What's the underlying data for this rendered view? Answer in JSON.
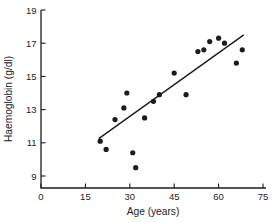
{
  "chart_data": {
    "type": "scatter",
    "title": "",
    "xlabel": "Age (years)",
    "ylabel": "Haemoglobin (g/dl)",
    "xlim": [
      0,
      75
    ],
    "ylim": [
      8.3,
      19
    ],
    "xticks": [
      0,
      15,
      30,
      45,
      60,
      75
    ],
    "yticks": [
      9,
      11,
      13,
      15,
      17,
      19
    ],
    "grid": false,
    "legend": "none",
    "marker": "filled-circle",
    "marker_color": "#1c1c1c",
    "points": [
      [
        20,
        11.1
      ],
      [
        22,
        10.6
      ],
      [
        25,
        12.4
      ],
      [
        28,
        13.1
      ],
      [
        29,
        14.0
      ],
      [
        31,
        10.4
      ],
      [
        32,
        9.5
      ],
      [
        35,
        12.5
      ],
      [
        38,
        13.5
      ],
      [
        40,
        13.9
      ],
      [
        45,
        15.2
      ],
      [
        49,
        13.9
      ],
      [
        53,
        16.5
      ],
      [
        55,
        16.6
      ],
      [
        57,
        17.1
      ],
      [
        60,
        17.3
      ],
      [
        62,
        17.0
      ],
      [
        66,
        15.8
      ],
      [
        68,
        16.6
      ]
    ],
    "trend_line": {
      "x": [
        19.5,
        68.5
      ],
      "y": [
        11.25,
        17.5
      ]
    }
  },
  "colors": {
    "ink": "#1c1c1c",
    "background": "#ffffff"
  }
}
